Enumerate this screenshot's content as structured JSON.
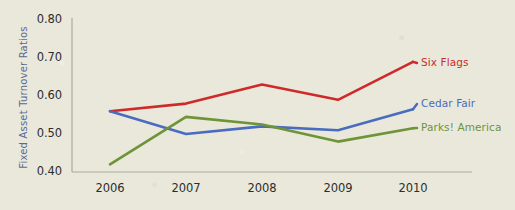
{
  "chart_data": {
    "type": "line",
    "title": "",
    "xlabel": "",
    "ylabel": "Fixed Asset Turnover Ratios",
    "categories": [
      "2006",
      "2007",
      "2008",
      "2009",
      "2010"
    ],
    "x": [
      2006,
      2007,
      2008,
      2009,
      2010
    ],
    "ylim": [
      0.4,
      0.8
    ],
    "yticks": [
      "0.40",
      "0.50",
      "0.60",
      "0.70",
      "0.80"
    ],
    "ytick_values": [
      0.4,
      0.5,
      0.6,
      0.7,
      0.8
    ],
    "grid": false,
    "legend_position": "right-inline-labels",
    "series": [
      {
        "name": "Six Flags",
        "color": "#cf2a2a",
        "values": [
          0.56,
          0.58,
          0.63,
          0.59,
          0.69
        ]
      },
      {
        "name": "Cedar Fair",
        "color": "#4a6cc0",
        "values": [
          0.56,
          0.5,
          0.52,
          0.51,
          0.565
        ]
      },
      {
        "name": "Parks! America",
        "color": "#6e9438",
        "values": [
          0.42,
          0.545,
          0.525,
          0.48,
          0.515
        ]
      }
    ]
  },
  "axis": {
    "spine_color": "#a9a99d",
    "background_color": "#e9e8db",
    "tick_text_color": "#2d2d2d",
    "ylabel_color": "#5b6a92"
  },
  "legend": {
    "items": [
      {
        "label": "Six Flags",
        "color": "#cf2a2a"
      },
      {
        "label": "Cedar Fair",
        "color": "#4a6cc0"
      },
      {
        "label": "Parks! America",
        "color": "#6e9438"
      }
    ]
  }
}
